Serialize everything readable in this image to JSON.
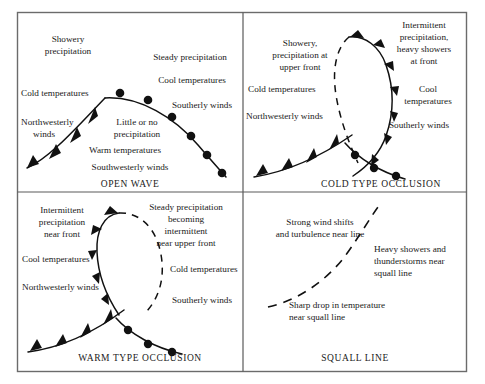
{
  "figure": {
    "background_color": "#ffffff",
    "line_color": "#111111",
    "frame_color": "#6b6b6b",
    "panel_count": 4
  },
  "panels": [
    {
      "id": "open-wave",
      "title": "OPEN WAVE",
      "front_types": [
        "cold front",
        "warm front"
      ],
      "annotations": [
        {
          "id": "showery-precipitation",
          "lines": [
            "Showery",
            "precipitation"
          ]
        },
        {
          "id": "cold-temperatures",
          "lines": [
            "Cold temperatures"
          ]
        },
        {
          "id": "northwesterly-winds",
          "lines": [
            "Northwesterly",
            "winds"
          ]
        },
        {
          "id": "little-or-no-precipitation",
          "lines": [
            "Little or no",
            "precipitation"
          ]
        },
        {
          "id": "warm-temperatures",
          "lines": [
            "Warm temperatures"
          ]
        },
        {
          "id": "southwesterly-winds",
          "lines": [
            "Southwesterly winds"
          ]
        },
        {
          "id": "steady-precipitation",
          "lines": [
            "Steady precipitation"
          ]
        },
        {
          "id": "cool-temperatures",
          "lines": [
            "Cool temperatures"
          ]
        },
        {
          "id": "southerly-winds",
          "lines": [
            "Southerly winds"
          ]
        }
      ]
    },
    {
      "id": "cold-type-occlusion",
      "title": "COLD TYPE OCCLUSION",
      "front_types": [
        "cold front",
        "warm front",
        "upper front"
      ],
      "annotations": [
        {
          "id": "showery-precipitation-upper-front",
          "lines": [
            "Showery,",
            "precipitation at",
            "upper front"
          ]
        },
        {
          "id": "cold-temperatures",
          "lines": [
            "Cold temperatures"
          ]
        },
        {
          "id": "northwesterly-winds",
          "lines": [
            "Northwesterly winds"
          ]
        },
        {
          "id": "intermittent-precipitation",
          "lines": [
            "Intermittent",
            "precipitation,",
            "heavy showers",
            "at front"
          ]
        },
        {
          "id": "cool-temperatures",
          "lines": [
            "Cool",
            "temperatures"
          ]
        },
        {
          "id": "southerly-winds",
          "lines": [
            "Southerly winds"
          ]
        }
      ]
    },
    {
      "id": "warm-type-occlusion",
      "title": "WARM TYPE OCCLUSION",
      "front_types": [
        "cold front",
        "warm front",
        "upper front"
      ],
      "annotations": [
        {
          "id": "intermittent-precipitation-near-front",
          "lines": [
            "Intermittent",
            "precipitation",
            "near front"
          ]
        },
        {
          "id": "cool-temperatures",
          "lines": [
            "Cool temperatures"
          ]
        },
        {
          "id": "northwesterly-winds",
          "lines": [
            "Northwesterly winds"
          ]
        },
        {
          "id": "steady-precipitation-becoming-intermittent",
          "lines": [
            "Steady precipitation",
            "becoming",
            "intermittent",
            "near upper front"
          ]
        },
        {
          "id": "cold-temperatures",
          "lines": [
            "Cold temperatures"
          ]
        },
        {
          "id": "southerly-winds",
          "lines": [
            "Southerly winds"
          ]
        }
      ]
    },
    {
      "id": "squall-line",
      "title": "SQUALL LINE",
      "front_types": [
        "squall line"
      ],
      "annotations": [
        {
          "id": "strong-wind-shifts",
          "lines": [
            "Strong wind shifts",
            "and turbulence near line"
          ]
        },
        {
          "id": "heavy-showers-thunderstorms",
          "lines": [
            "Heavy showers and",
            "thunderstorms near",
            "squall line"
          ]
        },
        {
          "id": "sharp-drop-in-temperature",
          "lines": [
            "Sharp drop in temperature",
            "near squall line"
          ]
        }
      ]
    }
  ]
}
